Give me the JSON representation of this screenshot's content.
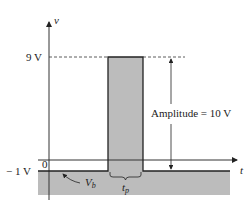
{
  "diagram": {
    "type": "pulse-waveform",
    "axes": {
      "y_label": "v",
      "x_label": "t",
      "origin_label": "0"
    },
    "levels": {
      "top": "9 V",
      "base": "− 1 V"
    },
    "annotations": {
      "amplitude": "Amplitude  =  10 V",
      "baseline_voltage": "V",
      "baseline_voltage_sub": "b",
      "pulse_width": "t",
      "pulse_width_sub": "p"
    },
    "colors": {
      "fill": "#b8b8b8",
      "line": "#222222",
      "background": "#ffffff"
    }
  }
}
